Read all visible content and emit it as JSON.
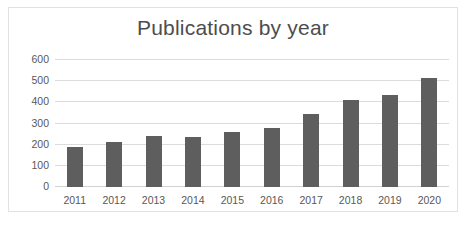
{
  "chart_data": {
    "type": "bar",
    "title": "Publications by year",
    "xlabel": "",
    "ylabel": "",
    "categories": [
      "2011",
      "2012",
      "2013",
      "2014",
      "2015",
      "2016",
      "2017",
      "2018",
      "2019",
      "2020"
    ],
    "values": [
      188,
      215,
      240,
      237,
      259,
      277,
      345,
      409,
      437,
      516
    ],
    "ylim": [
      0,
      600
    ],
    "yticks": [
      0,
      100,
      200,
      300,
      400,
      500,
      600
    ],
    "ytick_labels": [
      "0",
      "100",
      "200",
      "300",
      "400",
      "500",
      "600"
    ],
    "grid": true,
    "legend": false,
    "series": [
      {
        "name": "Publications",
        "values": [
          188,
          215,
          240,
          237,
          259,
          277,
          345,
          409,
          437,
          516
        ]
      }
    ],
    "colors": {
      "bar": "#5e5e5e",
      "gridline": "#dcdcdc",
      "title_text": "#4d4d4d",
      "tick_text": "#585858",
      "frame_border": "#e2e2e2",
      "background": "#ffffff"
    }
  }
}
